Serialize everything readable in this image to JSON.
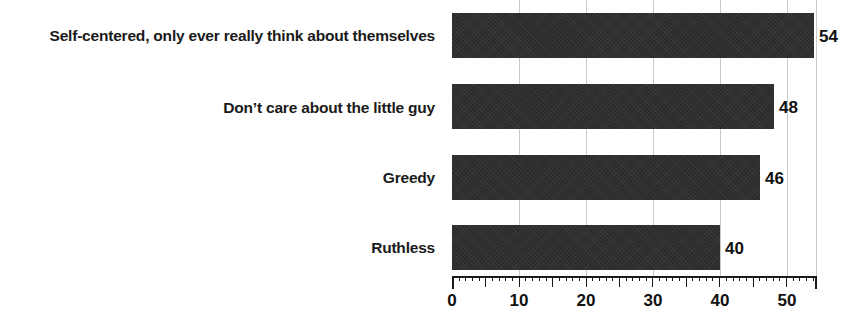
{
  "chart_data": {
    "type": "bar",
    "orientation": "horizontal",
    "title": "",
    "subtitle": "",
    "xlabel": "",
    "ylabel": "",
    "categories": [
      "Self-centered, only ever really think about themselves",
      "Don’t care about the little guy",
      "Greedy",
      "Ruthless"
    ],
    "values": [
      54,
      48,
      46,
      40
    ],
    "data_labels": [
      "54",
      "48",
      "46",
      "40"
    ],
    "xlim": [
      0,
      54.5
    ],
    "xticks": [
      0,
      10,
      20,
      30,
      40,
      50
    ],
    "xtick_labels": [
      "0",
      "10",
      "20",
      "30",
      "40",
      "50"
    ],
    "minor_tick_interval": 1,
    "major_tick_interval": 5,
    "grid": true,
    "grid_axis": "x",
    "gridlines_at": [
      10,
      20,
      30,
      40,
      50,
      54.5
    ],
    "legend": null,
    "bar_color": "#2b2b2b",
    "grid_color": "#c9c9c9",
    "text_color": "#111111",
    "background_color": "#ffffff"
  }
}
